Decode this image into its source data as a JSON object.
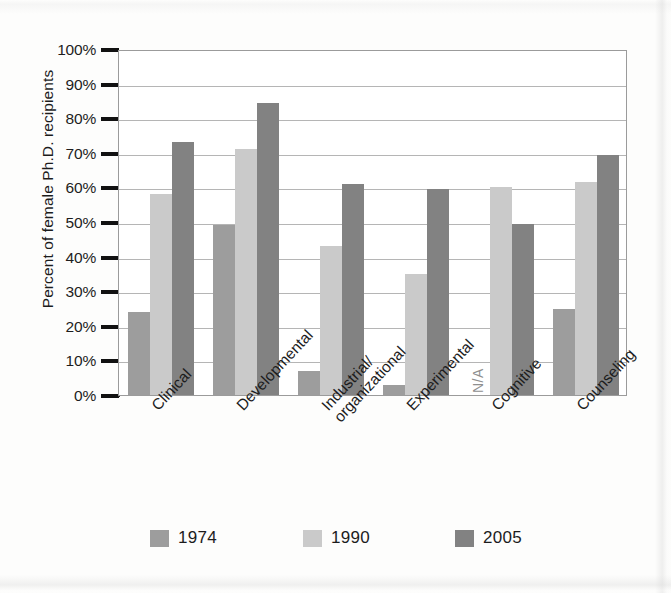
{
  "chart_data": {
    "type": "bar",
    "title": "",
    "subtitle": "",
    "xlabel": "",
    "ylabel": "Percent of female Ph.D. recipients",
    "ylim": [
      0,
      100
    ],
    "ytick_labels": [
      "100%",
      "90%",
      "80%",
      "70%",
      "60%",
      "50%",
      "40%",
      "30%",
      "20%",
      "10%",
      "0%"
    ],
    "ytick_values": [
      100,
      90,
      80,
      70,
      60,
      50,
      40,
      30,
      20,
      10,
      0
    ],
    "grid": "horizontal",
    "legend_position": "bottom",
    "categories": [
      "Clinical",
      "Developmental",
      "Industrial/organizational",
      "Experimental",
      "Cognitive",
      "Counseling"
    ],
    "category_lines": [
      [
        "Clinical"
      ],
      [
        "Developmental"
      ],
      [
        "Industrial/",
        "organizational"
      ],
      [
        "Experimental"
      ],
      [
        "Cognitive"
      ],
      [
        "Counseling"
      ]
    ],
    "series": [
      {
        "name": "1974",
        "color": "#9d9d9d",
        "values": [
          24,
          49,
          7,
          3,
          null,
          25
        ],
        "value_labels": [
          "24%",
          "49%",
          "7%",
          "3%",
          "N/A",
          "25%"
        ]
      },
      {
        "name": "1990",
        "color": "#cacaca",
        "values": [
          58,
          71,
          43,
          35,
          60,
          61.5
        ],
        "value_labels": [
          "58%",
          "71%",
          "43%",
          "35%",
          "60%",
          "61.5%"
        ]
      },
      {
        "name": "2005",
        "color": "#828282",
        "values": [
          73,
          84.5,
          61,
          59.5,
          49.5,
          69.5
        ],
        "value_labels": [
          "73%",
          "84.5%",
          "61%",
          "59.5%",
          "49.5%",
          "69.5%"
        ]
      }
    ],
    "missing_marker": "N/A",
    "missing_marker_series": "1974",
    "missing_marker_category": "Cognitive"
  },
  "legend": {
    "items": [
      {
        "label": "1974",
        "color": "#9d9d9d"
      },
      {
        "label": "1990",
        "color": "#cacaca"
      },
      {
        "label": "2005",
        "color": "#828282"
      }
    ]
  },
  "colors": {
    "axis": "#1d1d1d",
    "gridline": "#b5b5b5",
    "plot_border": "#9b9b9b",
    "background": "#fdfdfc",
    "text": "#1c1c1c",
    "na_text": "#8f8f8f"
  }
}
